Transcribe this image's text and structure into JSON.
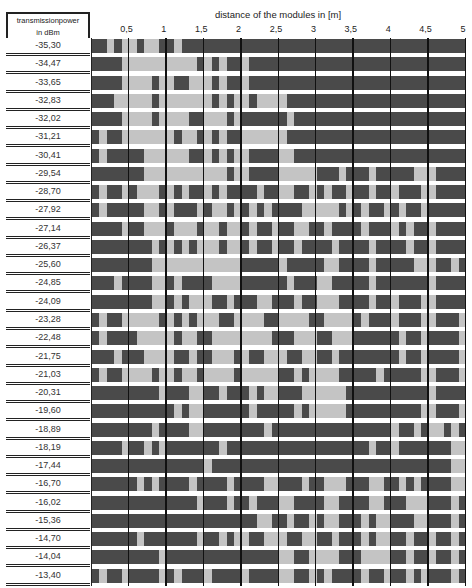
{
  "header": {
    "line1": "transmissionpower",
    "line2": "in dBm"
  },
  "chart_data": {
    "type": "heatmap",
    "title": "distance of the modules in [m]",
    "xlabel": "distance of the modules in [m]",
    "ylabel": "transmissionpower in dBm",
    "x_ticks": [
      "0,5",
      "1",
      "1,5",
      "2",
      "2,5",
      "3",
      "3,5",
      "4",
      "4,5",
      "5"
    ],
    "x_range": [
      0,
      5
    ],
    "cell_width_m": 0.1,
    "legend": {
      "dark": "#4a4a4a",
      "light": "#c4c4c4"
    },
    "rows": [
      {
        "power": "-35,30",
        "cells": "11010010011011111111111111111111111111111111111111"
      },
      {
        "power": "-34,47",
        "cells": "11110000000000101011011111111111111111111111111111"
      },
      {
        "power": "-33,65",
        "cells": "11110000100110001011011111111111111111111111111111"
      },
      {
        "power": "-32,83",
        "cells": "11100000100000001010010000111111111111111111111111"
      },
      {
        "power": "-32,02",
        "cells": "11110000100001100010111111011111111111111111111111"
      },
      {
        "power": "-31,21",
        "cells": "10110000000100101011000000111111111111111111111111"
      },
      {
        "power": "-30,41",
        "cells": "10111110000001101010011110011111111111111111111111"
      },
      {
        "power": "-29,54",
        "cells": "11111110000000000010011110000011101110111110001111"
      },
      {
        "power": "-28,70",
        "cells": "10110100010101101011110110011010110110110111001111"
      },
      {
        "power": "-27,92",
        "cells": "10111110010111010010101011110000010101101011011111"
      },
      {
        "power": "-27,14",
        "cells": "11110110001000100100101101100110111101110101101111"
      },
      {
        "power": "-26,37",
        "cells": "11111111010101000100101101101111011110111101101111"
      },
      {
        "power": "-25,60",
        "cells": "11111111000000000000111110111110011110111110001101"
      },
      {
        "power": "-24,85",
        "cells": "11101111001011110000111111011100111110111111101111"
      },
      {
        "power": "-24,09",
        "cells": "11111111001010001101110011101100011110110111001111"
      },
      {
        "power": "-23,28",
        "cells": "10110000010101000110000110000110000101110111001110"
      },
      {
        "power": "-22,48",
        "cells": "10111100000100110000000011100011000111111011011110"
      },
      {
        "power": "-21,75",
        "cells": "11101110000110110001011000110011011111111011011110"
      },
      {
        "power": "-21,03",
        "cells": "10110000100100100001000001101000011111011111001110"
      },
      {
        "power": "-20,31",
        "cells": "11111111101110011011101001110000001111111111101111"
      },
      {
        "power": "-19,60",
        "cells": "11111111111010011111101111101000001111111111001110"
      },
      {
        "power": "-18,89",
        "cells": "11111111011110011111111011111111111111110110100101"
      },
      {
        "power": "-18,19",
        "cells": "11110110101111111011111111111111111110110111111100"
      },
      {
        "power": "-17,44",
        "cells": "11111111111111101111111111111111111111111111111100"
      },
      {
        "power": "-16,70",
        "cells": "11111101011110111101111001110110001110011010111100"
      },
      {
        "power": "-16,02",
        "cells": "11111111111111011101101110011110011110011100011101"
      },
      {
        "power": "-15,36",
        "cells": "11111111111111111111110011011010011101001110011101"
      },
      {
        "power": "-14,70",
        "cells": "11111101111111011010011000110011011101001101101101"
      },
      {
        "power": "-14,04",
        "cells": "11111111101111111111111110011000011100001101101101"
      },
      {
        "power": "-13,40",
        "cells": "10110111101011101111011110011010111101101101011101"
      }
    ]
  }
}
